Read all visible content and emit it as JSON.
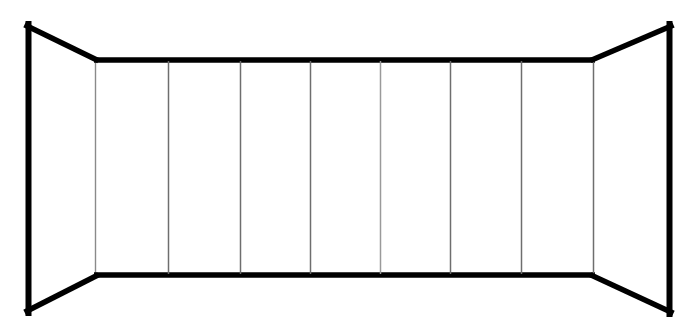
{
  "figure": {
    "title": "",
    "caption": "",
    "type": "line-drawing",
    "background_color": "#ffffff",
    "stroke_color": "#000000",
    "divider_color": "#6e6e6e",
    "outer_stroke_width": 5.5,
    "rail_stroke_width": 5,
    "divider_stroke_width": 1.4,
    "width": 699,
    "height": 333
  },
  "geometry": {
    "left_panel": {
      "name": "left-side-panel",
      "outer_top": {
        "x": 28,
        "y": 25
      },
      "outer_bottom": {
        "x": 28,
        "y": 312
      },
      "inner_top": {
        "x": 95,
        "y": 58
      },
      "inner_bottom": {
        "x": 95,
        "y": 277
      }
    },
    "right_panel": {
      "name": "right-side-panel",
      "outer_top": {
        "x": 670,
        "y": 25
      },
      "outer_bottom": {
        "x": 670,
        "y": 313
      },
      "inner_top": {
        "x": 594,
        "y": 58
      },
      "inner_bottom": {
        "x": 594,
        "y": 277
      }
    },
    "back_wall": {
      "name": "back-wall",
      "top_left": {
        "x": 95,
        "y": 58
      },
      "top_right": {
        "x": 594,
        "y": 58
      },
      "bottom_right": {
        "x": 594,
        "y": 277
      },
      "bottom_left": {
        "x": 95,
        "y": 277
      }
    },
    "divider_x_positions": [
      168,
      240,
      310,
      380,
      450,
      521
    ],
    "divider_top_y": 60,
    "divider_bottom_y": 275,
    "panel_count": 8
  },
  "labels": {
    "left_panel": "Left side panel",
    "right_panel": "Right side panel",
    "back_wall": "Back wall",
    "dividers": "Vertical slat dividers"
  }
}
